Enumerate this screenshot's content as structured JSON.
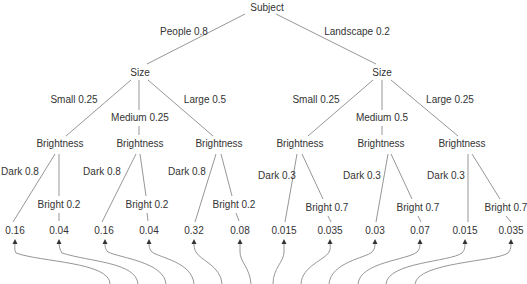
{
  "diagram": {
    "type": "probability-tree",
    "root": {
      "label": "Subject"
    },
    "level1_edges": [
      {
        "label": "People 0.8"
      },
      {
        "label": "Landscape 0.2"
      }
    ],
    "level1_nodes": [
      {
        "label": "Size"
      },
      {
        "label": "Size"
      }
    ],
    "level2_edges": [
      {
        "label": "Small 0.25"
      },
      {
        "label": "Medium 0.25"
      },
      {
        "label": "Large 0.5"
      },
      {
        "label": "Small 0.25"
      },
      {
        "label": "Medium 0.5"
      },
      {
        "label": "Large 0.25"
      }
    ],
    "level2_nodes": [
      {
        "label": "Brightness"
      },
      {
        "label": "Brightness"
      },
      {
        "label": "Brightness"
      },
      {
        "label": "Brightness"
      },
      {
        "label": "Brightness"
      },
      {
        "label": "Brightness"
      }
    ],
    "level3_edges": [
      {
        "label": "Dark 0.8"
      },
      {
        "label": "Bright 0.2"
      },
      {
        "label": "Dark 0.8"
      },
      {
        "label": "Bright 0.2"
      },
      {
        "label": "Dark 0.8"
      },
      {
        "label": "Bright 0.2"
      },
      {
        "label": "Dark 0.3"
      },
      {
        "label": "Bright 0.7"
      },
      {
        "label": "Dark 0.3"
      },
      {
        "label": "Bright 0.7"
      },
      {
        "label": "Dark 0.3"
      },
      {
        "label": "Bright 0.7"
      }
    ],
    "leaves": [
      {
        "value": "0.16"
      },
      {
        "value": "0.04"
      },
      {
        "value": "0.16"
      },
      {
        "value": "0.04"
      },
      {
        "value": "0.32"
      },
      {
        "value": "0.08"
      },
      {
        "value": "0.015"
      },
      {
        "value": "0.035"
      },
      {
        "value": "0.03"
      },
      {
        "value": "0.07"
      },
      {
        "value": "0.015"
      },
      {
        "value": "0.035"
      }
    ],
    "colors": {
      "edge": "#8a8a8a",
      "text": "#333333",
      "arrowhead": "#333333",
      "background": "#ffffff"
    }
  }
}
